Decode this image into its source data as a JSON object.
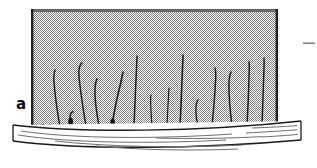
{
  "figure": {
    "panel_label": "a",
    "caption_visible": "",
    "background_color": "#ffffff",
    "ink_color": "#1a1a1a",
    "dither_gray": "#808080",
    "skin_band_fill": "#ffffff",
    "skin_band_stroke": "#1a1a1a"
  },
  "dermis_field": {
    "name": "stippled-dermis-field",
    "x": 31,
    "y": 9,
    "width": 247,
    "height": 117,
    "fill_pattern": "50-percent-checkerboard-dither",
    "fill_color": "#808080",
    "border_top_color": "#4d4d4d",
    "border_left_color": "#262626",
    "border_right_color": "#262626"
  },
  "skin_band": {
    "name": "skin-surface-band",
    "left_x": 13,
    "right_x": 301,
    "top_y": 123,
    "bottom_y": 152,
    "sag_depth": 9,
    "texture_line_count": 8
  },
  "follicle_row": {
    "name": "follicle-openings-row",
    "opening_count": 34,
    "start_x": 36,
    "end_x": 278,
    "bump_width": 7,
    "bump_height": 4
  },
  "hairs": [
    {
      "id": "hair-1",
      "base_x": 60,
      "base_y": 126,
      "tip_x": 55,
      "tip_y": 70,
      "bow": -6,
      "type": "anagen",
      "club_root": false
    },
    {
      "id": "hair-2",
      "base_x": 71,
      "base_y": 125,
      "tip_x": 73,
      "tip_y": 112,
      "bow": 3,
      "type": "telogen",
      "club_root": true
    },
    {
      "id": "hair-3",
      "base_x": 86,
      "base_y": 124,
      "tip_x": 82,
      "tip_y": 63,
      "bow": -7,
      "type": "anagen",
      "club_root": false
    },
    {
      "id": "hair-4",
      "base_x": 99,
      "base_y": 124,
      "tip_x": 97,
      "tip_y": 79,
      "bow": -5,
      "type": "anagen",
      "club_root": false
    },
    {
      "id": "hair-5",
      "base_x": 112,
      "base_y": 124,
      "tip_x": 123,
      "tip_y": 72,
      "bow": 8,
      "type": "anagen",
      "club_root": true
    },
    {
      "id": "hair-6",
      "base_x": 134,
      "base_y": 124,
      "tip_x": 137,
      "tip_y": 56,
      "bow": 5,
      "type": "anagen",
      "club_root": false
    },
    {
      "id": "hair-7",
      "base_x": 152,
      "base_y": 125,
      "tip_x": 151,
      "tip_y": 95,
      "bow": -3,
      "type": "vellus",
      "club_root": false
    },
    {
      "id": "hair-8",
      "base_x": 167,
      "base_y": 125,
      "tip_x": 169,
      "tip_y": 88,
      "bow": 4,
      "type": "vellus",
      "club_root": false
    },
    {
      "id": "hair-9",
      "base_x": 180,
      "base_y": 125,
      "tip_x": 183,
      "tip_y": 55,
      "bow": 4,
      "type": "anagen",
      "club_root": false
    },
    {
      "id": "hair-10",
      "base_x": 198,
      "base_y": 124,
      "tip_x": 198,
      "tip_y": 100,
      "bow": 5,
      "type": "telogen",
      "club_root": false
    },
    {
      "id": "hair-11",
      "base_x": 212,
      "base_y": 124,
      "tip_x": 215,
      "tip_y": 68,
      "bow": 7,
      "type": "anagen",
      "club_root": false
    },
    {
      "id": "hair-12",
      "base_x": 232,
      "base_y": 124,
      "tip_x": 231,
      "tip_y": 72,
      "bow": -6,
      "type": "anagen",
      "club_root": false
    },
    {
      "id": "hair-13",
      "base_x": 247,
      "base_y": 124,
      "tip_x": 249,
      "tip_y": 62,
      "bow": 6,
      "type": "anagen",
      "club_root": false
    },
    {
      "id": "hair-14",
      "base_x": 262,
      "base_y": 124,
      "tip_x": 264,
      "tip_y": 58,
      "bow": -4,
      "type": "anagen",
      "club_root": false
    }
  ],
  "marker": {
    "name": "scale-dash-marker",
    "x": 303,
    "y": 43,
    "length": 12,
    "thickness": 1,
    "color": "#6e6e6e"
  }
}
